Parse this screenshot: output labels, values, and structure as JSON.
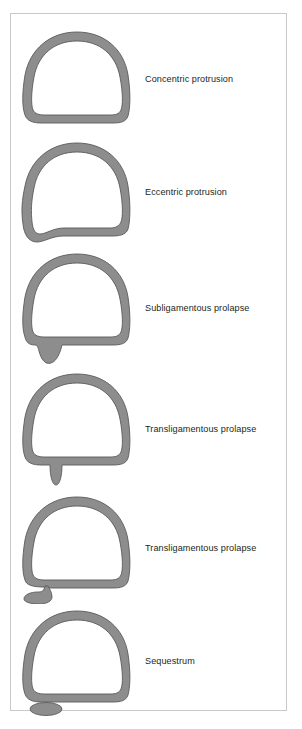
{
  "figure": {
    "border_color": "#c9c9c9",
    "background_color": "#ffffff",
    "shape_fill_color": "#8d8d8d",
    "shape_stroke_color": "#575757",
    "label_color": "#231f20"
  },
  "rows": [
    {
      "label": "Concentric protrusion",
      "shape_name": "concentric-protrusion-diagram",
      "description": "Closed annulus ring, uniform bulge, no focal herniation"
    },
    {
      "label": "Eccentric protrusion",
      "shape_name": "eccentric-protrusion-diagram",
      "description": "Annulus ring with a broad asymmetric bulge at the posterior-left margin"
    },
    {
      "label": "Subligamentous prolapse",
      "shape_name": "subligamentous-prolapse-diagram",
      "description": "Annulus ring with a broad teardrop of nucleus material extending below the ring"
    },
    {
      "label": "Transligamentous prolapse",
      "shape_name": "transligamentous-prolapse-diagram-1",
      "description": "Annulus ring with a narrow spike of nucleus material piercing through below the ring"
    },
    {
      "label": "Transligamentous prolapse",
      "shape_name": "transligamentous-prolapse-diagram-2",
      "description": "Annulus ring with a short stalk ending in a rounded extruded fragment still attached"
    },
    {
      "label": "Sequestrum",
      "shape_name": "sequestrum-diagram",
      "description": "Intact annulus ring with a completely detached free fragment lying below"
    }
  ]
}
